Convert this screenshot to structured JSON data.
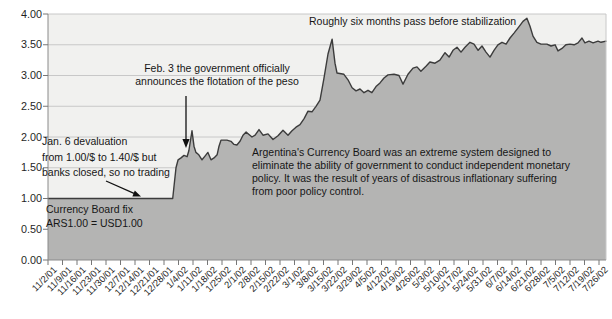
{
  "colors": {
    "plot_bg": "#f1f1ef",
    "grid": "#c8c8c8",
    "area_fill": "#b4b4b3",
    "line": "#3c3c3c",
    "axis": "#8a8a8a",
    "tick": "#777777",
    "arrow": "#111111",
    "text": "#1f1f1f"
  },
  "chart_data": {
    "type": "area",
    "title": "",
    "xlabel": "",
    "ylabel": "",
    "ylim": [
      0,
      4
    ],
    "grid": "horizontal",
    "legend": "none",
    "y_tick_labels": [
      "0.00",
      "0.50",
      "1.00",
      "1.50",
      "2.00",
      "2.50",
      "3.00",
      "3.50",
      "4.00"
    ],
    "x_tick_labels": [
      "11/2/01",
      "11/9/01",
      "11/16/01",
      "11/23/01",
      "11/30/01",
      "12/7/01",
      "12/14/01",
      "12/21/01",
      "12/28/01",
      "1/4/02",
      "1/11/02",
      "1/18/02",
      "1/25/02",
      "2/1/02",
      "2/8/02",
      "2/15/02",
      "2/22/02",
      "3/1/02",
      "3/8/02",
      "3/15/02",
      "3/22/02",
      "3/29/02",
      "4/5/02",
      "4/12/02",
      "4/19/02",
      "4/26/02",
      "5/3/02",
      "5/10/02",
      "5/17/02",
      "5/24/02",
      "5/31/02",
      "6/7/02",
      "6/14/02",
      "6/21/02",
      "6/28/02",
      "7/5/02",
      "7/12/02",
      "7/19/02",
      "7/26/02"
    ],
    "series": [
      {
        "name": "ARS per USD exchange rate",
        "x_unit": "weeks since 11/2/01",
        "points": [
          [
            0,
            1.0
          ],
          [
            8.6,
            1.0
          ],
          [
            8.83,
            1.5
          ],
          [
            8.97,
            1.63
          ],
          [
            9.17,
            1.66
          ],
          [
            9.38,
            1.7
          ],
          [
            9.59,
            1.68
          ],
          [
            9.72,
            1.78
          ],
          [
            9.93,
            2.1
          ],
          [
            10.07,
            1.85
          ],
          [
            10.2,
            1.75
          ],
          [
            10.4,
            1.71
          ],
          [
            10.62,
            1.63
          ],
          [
            10.83,
            1.69
          ],
          [
            11.03,
            1.75
          ],
          [
            11.24,
            1.63
          ],
          [
            11.45,
            1.66
          ],
          [
            11.66,
            1.71
          ],
          [
            11.79,
            1.85
          ],
          [
            11.93,
            1.95
          ],
          [
            12.34,
            1.95
          ],
          [
            12.62,
            1.93
          ],
          [
            12.83,
            1.88
          ],
          [
            13.03,
            1.87
          ],
          [
            13.24,
            1.93
          ],
          [
            13.45,
            2.03
          ],
          [
            13.66,
            2.08
          ],
          [
            13.86,
            2.04
          ],
          [
            14.07,
            2.0
          ],
          [
            14.28,
            2.03
          ],
          [
            14.55,
            2.12
          ],
          [
            14.83,
            2.03
          ],
          [
            15.17,
            2.05
          ],
          [
            15.52,
            1.96
          ],
          [
            15.86,
            2.02
          ],
          [
            16.21,
            2.11
          ],
          [
            16.55,
            2.03
          ],
          [
            16.83,
            2.1
          ],
          [
            17.1,
            2.16
          ],
          [
            17.38,
            2.2
          ],
          [
            17.66,
            2.3
          ],
          [
            17.93,
            2.42
          ],
          [
            18.21,
            2.41
          ],
          [
            18.48,
            2.5
          ],
          [
            18.76,
            2.6
          ],
          [
            19.03,
            2.95
          ],
          [
            19.31,
            3.35
          ],
          [
            19.59,
            3.59
          ],
          [
            19.79,
            3.2
          ],
          [
            19.93,
            3.04
          ],
          [
            20.41,
            3.02
          ],
          [
            20.69,
            2.93
          ],
          [
            20.97,
            2.8
          ],
          [
            21.24,
            2.75
          ],
          [
            21.52,
            2.78
          ],
          [
            21.79,
            2.72
          ],
          [
            22.07,
            2.76
          ],
          [
            22.34,
            2.72
          ],
          [
            22.62,
            2.82
          ],
          [
            22.9,
            2.88
          ],
          [
            23.17,
            2.96
          ],
          [
            23.45,
            3.01
          ],
          [
            23.86,
            3.02
          ],
          [
            24.21,
            3.0
          ],
          [
            24.48,
            2.86
          ],
          [
            24.83,
            3.02
          ],
          [
            25.17,
            3.12
          ],
          [
            25.45,
            3.14
          ],
          [
            25.72,
            3.07
          ],
          [
            26.07,
            3.15
          ],
          [
            26.34,
            3.22
          ],
          [
            26.69,
            3.2
          ],
          [
            27.03,
            3.25
          ],
          [
            27.38,
            3.37
          ],
          [
            27.66,
            3.3
          ],
          [
            27.93,
            3.41
          ],
          [
            28.21,
            3.46
          ],
          [
            28.48,
            3.38
          ],
          [
            28.76,
            3.46
          ],
          [
            29.1,
            3.54
          ],
          [
            29.38,
            3.51
          ],
          [
            29.66,
            3.41
          ],
          [
            29.93,
            3.48
          ],
          [
            30.21,
            3.38
          ],
          [
            30.48,
            3.3
          ],
          [
            30.76,
            3.41
          ],
          [
            31.03,
            3.5
          ],
          [
            31.31,
            3.54
          ],
          [
            31.59,
            3.51
          ],
          [
            31.86,
            3.61
          ],
          [
            32.14,
            3.69
          ],
          [
            32.41,
            3.77
          ],
          [
            32.76,
            3.88
          ],
          [
            33.03,
            3.93
          ],
          [
            33.24,
            3.8
          ],
          [
            33.45,
            3.64
          ],
          [
            33.72,
            3.54
          ],
          [
            34.0,
            3.51
          ],
          [
            34.41,
            3.51
          ],
          [
            34.69,
            3.48
          ],
          [
            34.97,
            3.5
          ],
          [
            35.17,
            3.4
          ],
          [
            35.45,
            3.44
          ],
          [
            35.72,
            3.5
          ],
          [
            36.0,
            3.51
          ],
          [
            36.28,
            3.5
          ],
          [
            36.55,
            3.53
          ],
          [
            36.83,
            3.61
          ],
          [
            37.03,
            3.53
          ],
          [
            37.31,
            3.56
          ],
          [
            37.59,
            3.53
          ],
          [
            37.93,
            3.56
          ],
          [
            38.14,
            3.54
          ],
          [
            38.48,
            3.56
          ]
        ]
      }
    ],
    "annotations": {
      "stabilization": "Roughly six months pass before stabilization",
      "flotation": "Feb. 3 the government officially\nannounces the flotation of the peso",
      "devaluation": "Jan. 6 devaluation\nfrom 1.00/$ to 1.40/$ but\nbanks closed, so no trading",
      "board_fix": "Currency Board fix\nARS1.00 = USD1.00",
      "board_note": "Argentina's Currency Board was an extreme system designed to\neliminate the ability of government to conduct independent monetary\npolicy. It was the result of years of disastrous inflationary suffering\nfrom poor policy control."
    }
  }
}
